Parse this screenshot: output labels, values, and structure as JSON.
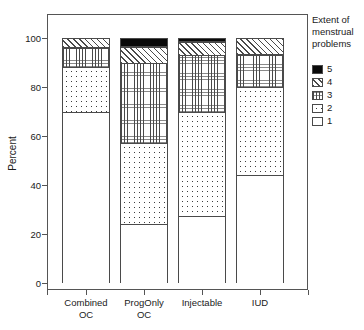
{
  "chart_data": {
    "type": "bar",
    "subtype": "stacked-bar-percent",
    "title": "",
    "xlabel": "",
    "ylabel": "Percent",
    "ylim": [
      0,
      105
    ],
    "yticks": [
      0,
      20,
      40,
      60,
      80,
      100
    ],
    "ytick_labels": [
      "0",
      "20",
      "40",
      "60",
      "80",
      "100"
    ],
    "grid": false,
    "legend_position": "right",
    "legend_title": "Extent of menstrual problems",
    "legend_title_lines": [
      "Extent of",
      "menstrual",
      "problems"
    ],
    "categories": [
      "Combined OC",
      "ProgOnly OC",
      "Injectable",
      "IUD"
    ],
    "category_label_lines": [
      [
        "Combined",
        "OC"
      ],
      [
        "ProgOnly",
        "OC"
      ],
      [
        "Injectable",
        ""
      ],
      [
        "IUD",
        ""
      ]
    ],
    "stack_order_bottom_to_top": [
      "1",
      "2",
      "3",
      "4",
      "5"
    ],
    "series": [
      {
        "name": "1",
        "values": [
          70.0,
          24.0,
          27.5,
          44.0
        ]
      },
      {
        "name": "2",
        "values": [
          18.0,
          33.0,
          42.5,
          36.0
        ]
      },
      {
        "name": "3",
        "values": [
          8.0,
          33.0,
          23.0,
          13.0
        ]
      },
      {
        "name": "4",
        "values": [
          4.0,
          6.5,
          5.5,
          7.0
        ]
      },
      {
        "name": "5",
        "values": [
          0.0,
          3.5,
          1.5,
          0.0
        ]
      }
    ],
    "cumulative_tops": {
      "Combined OC": [
        70.0,
        88.0,
        96.0,
        100.0,
        100.0
      ],
      "ProgOnly OC": [
        24.0,
        57.0,
        90.0,
        96.5,
        100.0
      ],
      "Injectable": [
        27.5,
        70.0,
        93.0,
        98.5,
        100.0
      ],
      "IUD": [
        44.0,
        80.0,
        93.0,
        100.0,
        100.0
      ]
    },
    "legend_entries": [
      {
        "label": "5",
        "pattern": "solid-black",
        "color": "#0a0a0a"
      },
      {
        "label": "4",
        "pattern": "diagonal-hatch",
        "color": "#ffffff"
      },
      {
        "label": "3",
        "pattern": "fine-grid",
        "color": "#ffffff"
      },
      {
        "label": "2",
        "pattern": "sparse-dots",
        "color": "#ffffff"
      },
      {
        "label": "1",
        "pattern": "empty",
        "color": "#ffffff"
      }
    ]
  },
  "axis": {
    "ylabel": "Percent",
    "ytick_labels": [
      "100",
      "80",
      "60",
      "40",
      "20",
      "0"
    ]
  },
  "legend": {
    "title_line_1": "Extent of",
    "title_line_2": "menstrual",
    "title_line_3": "problems",
    "items": [
      {
        "label": "5"
      },
      {
        "label": "4"
      },
      {
        "label": "3"
      },
      {
        "label": "2"
      },
      {
        "label": "1"
      }
    ]
  },
  "xlabels": [
    {
      "line1": "Combined",
      "line2": "OC"
    },
    {
      "line1": "ProgOnly",
      "line2": "OC"
    },
    {
      "line1": "Injectable",
      "line2": ""
    },
    {
      "line1": "IUD",
      "line2": ""
    }
  ]
}
